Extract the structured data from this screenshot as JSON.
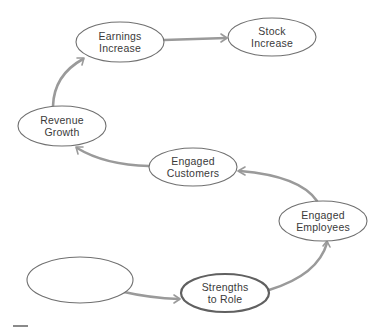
{
  "diagram": {
    "type": "flow-chain",
    "nodes": [
      {
        "id": "earnings",
        "line1": "Earnings",
        "line2": "Increase",
        "cx": 120,
        "cy": 42,
        "rx": 44,
        "ry": 20,
        "bold": false
      },
      {
        "id": "stock",
        "line1": "Stock",
        "line2": "Increase",
        "cx": 272,
        "cy": 37,
        "rx": 44,
        "ry": 19,
        "bold": false
      },
      {
        "id": "revenue",
        "line1": "Revenue",
        "line2": "Growth",
        "cx": 62,
        "cy": 126,
        "rx": 44,
        "ry": 20,
        "bold": false
      },
      {
        "id": "customers",
        "line1": "Engaged",
        "line2": "Customers",
        "cx": 193,
        "cy": 167,
        "rx": 44,
        "ry": 19,
        "bold": false
      },
      {
        "id": "employees",
        "line1": "Engaged",
        "line2": "Employees",
        "cx": 323,
        "cy": 221,
        "rx": 44,
        "ry": 20,
        "bold": false
      },
      {
        "id": "blank",
        "line1": "",
        "line2": "",
        "cx": 80,
        "cy": 280,
        "rx": 53,
        "ry": 23,
        "bold": false
      },
      {
        "id": "strengths",
        "line1": "Strengths",
        "line2": "to Role",
        "cx": 225,
        "cy": 293,
        "rx": 44,
        "ry": 19,
        "bold": true
      }
    ],
    "edges": [
      {
        "from": "blank",
        "to": "strengths"
      },
      {
        "from": "strengths",
        "to": "employees"
      },
      {
        "from": "employees",
        "to": "customers"
      },
      {
        "from": "customers",
        "to": "revenue"
      },
      {
        "from": "revenue",
        "to": "earnings"
      },
      {
        "from": "earnings",
        "to": "stock"
      }
    ],
    "colors": {
      "node_stroke": "#707070",
      "edge": "#9a9a9a",
      "text": "#3a3a3a",
      "background": "#ffffff"
    }
  }
}
